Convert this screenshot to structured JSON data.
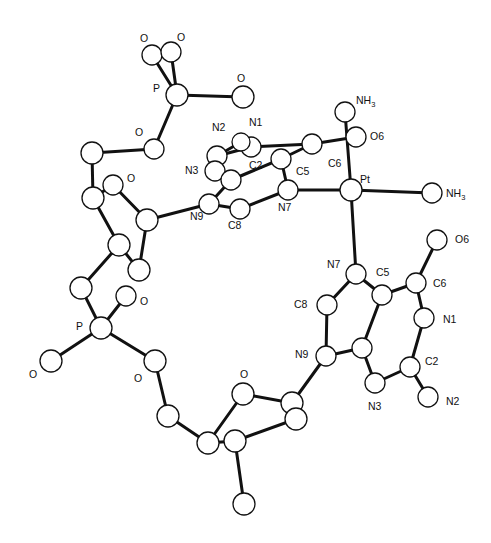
{
  "diagram": {
    "type": "ORTEP molecular structure",
    "colors": {
      "ink": "#111111",
      "background": "#ffffff",
      "atom_fill": "#ffffff"
    },
    "atoms": [
      {
        "id": "pt",
        "x": 351,
        "y": 190,
        "r": 11
      },
      {
        "id": "nh3_top",
        "x": 345,
        "y": 112,
        "r": 10
      },
      {
        "id": "nh3_right",
        "x": 432,
        "y": 193,
        "r": 10
      },
      {
        "id": "g1_n7",
        "x": 288,
        "y": 190,
        "r": 10
      },
      {
        "id": "g1_c5",
        "x": 281,
        "y": 159,
        "r": 10
      },
      {
        "id": "g1_c6",
        "x": 312,
        "y": 144,
        "r": 10
      },
      {
        "id": "g1_o6",
        "x": 356,
        "y": 137,
        "r": 10
      },
      {
        "id": "g1_n1",
        "x": 251,
        "y": 147,
        "r": 10
      },
      {
        "id": "g1_c2",
        "x": 217,
        "y": 156,
        "r": 10
      },
      {
        "id": "g1_n2",
        "x": 241,
        "y": 142,
        "r": 9
      },
      {
        "id": "g1_n3",
        "x": 215,
        "y": 171,
        "r": 10
      },
      {
        "id": "g1_c4",
        "x": 231,
        "y": 180,
        "r": 10
      },
      {
        "id": "g1_c8",
        "x": 240,
        "y": 209,
        "r": 10
      },
      {
        "id": "g1_n9",
        "x": 209,
        "y": 204,
        "r": 10
      },
      {
        "id": "g2_n7",
        "x": 356,
        "y": 274,
        "r": 10
      },
      {
        "id": "g2_c5",
        "x": 382,
        "y": 295,
        "r": 10
      },
      {
        "id": "g2_c6",
        "x": 416,
        "y": 283,
        "r": 10
      },
      {
        "id": "g2_o6",
        "x": 437,
        "y": 240,
        "r": 10
      },
      {
        "id": "g2_n1",
        "x": 424,
        "y": 318,
        "r": 10
      },
      {
        "id": "g2_c2",
        "x": 410,
        "y": 367,
        "r": 10
      },
      {
        "id": "g2_n2",
        "x": 428,
        "y": 397,
        "r": 10
      },
      {
        "id": "g2_n3",
        "x": 375,
        "y": 383,
        "r": 10
      },
      {
        "id": "g2_c4",
        "x": 362,
        "y": 348,
        "r": 10
      },
      {
        "id": "g2_c8",
        "x": 327,
        "y": 305,
        "r": 10
      },
      {
        "id": "g2_n9",
        "x": 326,
        "y": 356,
        "r": 10
      },
      {
        "id": "p_top",
        "x": 177,
        "y": 95,
        "r": 11
      },
      {
        "id": "p_top_o1",
        "x": 152,
        "y": 55,
        "r": 10
      },
      {
        "id": "p_top_o2",
        "x": 171,
        "y": 52,
        "r": 10
      },
      {
        "id": "p_top_o3",
        "x": 243,
        "y": 97,
        "r": 11
      },
      {
        "id": "p_top_o4",
        "x": 154,
        "y": 149,
        "r": 10
      },
      {
        "id": "s1_c5p",
        "x": 92,
        "y": 153,
        "r": 11
      },
      {
        "id": "s1_c4p",
        "x": 93,
        "y": 198,
        "r": 11
      },
      {
        "id": "s1_o4p",
        "x": 113,
        "y": 185,
        "r": 10
      },
      {
        "id": "s1_c1p",
        "x": 147,
        "y": 220,
        "r": 11
      },
      {
        "id": "s1_c3p",
        "x": 119,
        "y": 245,
        "r": 11
      },
      {
        "id": "s1_c2p",
        "x": 139,
        "y": 270,
        "r": 11
      },
      {
        "id": "s1_o3p",
        "x": 81,
        "y": 288,
        "r": 11
      },
      {
        "id": "p_mid",
        "x": 101,
        "y": 328,
        "r": 11
      },
      {
        "id": "p_mid_o1",
        "x": 126,
        "y": 296,
        "r": 10
      },
      {
        "id": "p_mid_o2",
        "x": 51,
        "y": 361,
        "r": 11
      },
      {
        "id": "p_mid_o5",
        "x": 155,
        "y": 361,
        "r": 11
      },
      {
        "id": "s2_c5p",
        "x": 168,
        "y": 416,
        "r": 11
      },
      {
        "id": "s2_c4p",
        "x": 208,
        "y": 443,
        "r": 11
      },
      {
        "id": "s2_o4p",
        "x": 243,
        "y": 394,
        "r": 11
      },
      {
        "id": "s2_c1p",
        "x": 292,
        "y": 403,
        "r": 11
      },
      {
        "id": "s2_c2p",
        "x": 296,
        "y": 419,
        "r": 11
      },
      {
        "id": "s2_c3p",
        "x": 235,
        "y": 441,
        "r": 11
      },
      {
        "id": "s2_c_ext",
        "x": 244,
        "y": 504,
        "r": 11
      }
    ],
    "bonds": [
      [
        "pt",
        "nh3_top"
      ],
      [
        "pt",
        "nh3_right"
      ],
      [
        "pt",
        "g1_n7"
      ],
      [
        "pt",
        "g2_n7"
      ],
      [
        "g1_n7",
        "g1_c5"
      ],
      [
        "g1_c5",
        "g1_c6"
      ],
      [
        "g1_c6",
        "g1_o6"
      ],
      [
        "g1_c6",
        "g1_n1"
      ],
      [
        "g1_n1",
        "g1_c2"
      ],
      [
        "g1_c2",
        "g1_n2"
      ],
      [
        "g1_c2",
        "g1_n3"
      ],
      [
        "g1_n3",
        "g1_c4"
      ],
      [
        "g1_c4",
        "g1_c5"
      ],
      [
        "g1_c4",
        "g1_n9"
      ],
      [
        "g1_n9",
        "g1_c8"
      ],
      [
        "g1_c8",
        "g1_n7"
      ],
      [
        "g1_n9",
        "s1_c1p"
      ],
      [
        "g2_n7",
        "g2_c5"
      ],
      [
        "g2_c5",
        "g2_c6"
      ],
      [
        "g2_c6",
        "g2_o6"
      ],
      [
        "g2_c6",
        "g2_n1"
      ],
      [
        "g2_n1",
        "g2_c2"
      ],
      [
        "g2_c2",
        "g2_n2"
      ],
      [
        "g2_c2",
        "g2_n3"
      ],
      [
        "g2_n3",
        "g2_c4"
      ],
      [
        "g2_c4",
        "g2_c5"
      ],
      [
        "g2_c4",
        "g2_n9"
      ],
      [
        "g2_n9",
        "g2_c8"
      ],
      [
        "g2_c8",
        "g2_n7"
      ],
      [
        "g2_n9",
        "s2_c1p"
      ],
      [
        "p_top",
        "p_top_o1"
      ],
      [
        "p_top",
        "p_top_o2"
      ],
      [
        "p_top",
        "p_top_o3"
      ],
      [
        "p_top",
        "p_top_o4"
      ],
      [
        "p_top_o4",
        "s1_c5p"
      ],
      [
        "s1_c5p",
        "s1_c4p"
      ],
      [
        "s1_c4p",
        "s1_o4p"
      ],
      [
        "s1_o4p",
        "s1_c1p"
      ],
      [
        "s1_c1p",
        "s1_c2p"
      ],
      [
        "s1_c2p",
        "s1_c3p"
      ],
      [
        "s1_c3p",
        "s1_c4p"
      ],
      [
        "s1_c3p",
        "s1_o3p"
      ],
      [
        "s1_o3p",
        "p_mid"
      ],
      [
        "p_mid",
        "p_mid_o1"
      ],
      [
        "p_mid",
        "p_mid_o2"
      ],
      [
        "p_mid",
        "p_mid_o5"
      ],
      [
        "p_mid_o5",
        "s2_c5p"
      ],
      [
        "s2_c5p",
        "s2_c4p"
      ],
      [
        "s2_c4p",
        "s2_o4p"
      ],
      [
        "s2_o4p",
        "s2_c1p"
      ],
      [
        "s2_c1p",
        "s2_c2p"
      ],
      [
        "s2_c2p",
        "s2_c3p"
      ],
      [
        "s2_c3p",
        "s2_c4p"
      ],
      [
        "s2_c3p",
        "s2_c_ext"
      ]
    ],
    "labels": [
      {
        "text": "Pt",
        "x": 360,
        "y": 183
      },
      {
        "text": "NH",
        "sub": "3",
        "x": 356,
        "y": 104
      },
      {
        "text": "NH",
        "sub": "3",
        "x": 446,
        "y": 197
      },
      {
        "text": "O6",
        "x": 370,
        "y": 140
      },
      {
        "text": "N1",
        "x": 249,
        "y": 126
      },
      {
        "text": "N2",
        "x": 212,
        "y": 131
      },
      {
        "text": "C2",
        "x": 249,
        "y": 169
      },
      {
        "text": "C6",
        "x": 328,
        "y": 167
      },
      {
        "text": "N3",
        "x": 185,
        "y": 174
      },
      {
        "text": "C5",
        "x": 296,
        "y": 175
      },
      {
        "text": "N7",
        "x": 278,
        "y": 211
      },
      {
        "text": "N9",
        "x": 190,
        "y": 220
      },
      {
        "text": "C8",
        "x": 228,
        "y": 229
      },
      {
        "text": "O6",
        "x": 455,
        "y": 243
      },
      {
        "text": "N7",
        "x": 327,
        "y": 268
      },
      {
        "text": "C5",
        "x": 376,
        "y": 276
      },
      {
        "text": "C6",
        "x": 433,
        "y": 287
      },
      {
        "text": "C8",
        "x": 294,
        "y": 308
      },
      {
        "text": "N1",
        "x": 443,
        "y": 323
      },
      {
        "text": "N9",
        "x": 295,
        "y": 358
      },
      {
        "text": "C2",
        "x": 425,
        "y": 365
      },
      {
        "text": "N3",
        "x": 368,
        "y": 410
      },
      {
        "text": "N2",
        "x": 446,
        "y": 405
      },
      {
        "text": "P",
        "x": 153,
        "y": 92
      },
      {
        "text": "O",
        "x": 140,
        "y": 42
      },
      {
        "text": "O",
        "x": 177,
        "y": 41
      },
      {
        "text": "O",
        "x": 237,
        "y": 82
      },
      {
        "text": "O",
        "x": 135,
        "y": 136
      },
      {
        "text": "O",
        "x": 127,
        "y": 182
      },
      {
        "text": "O",
        "x": 140,
        "y": 305
      },
      {
        "text": "P",
        "x": 76,
        "y": 330
      },
      {
        "text": "O",
        "x": 29,
        "y": 378
      },
      {
        "text": "O",
        "x": 134,
        "y": 382
      },
      {
        "text": "O",
        "x": 240,
        "y": 378
      }
    ]
  }
}
